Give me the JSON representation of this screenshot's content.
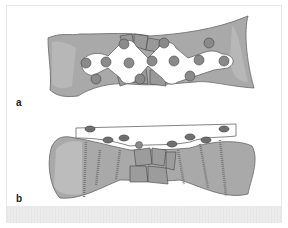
{
  "figure": {
    "panels": [
      {
        "id": "a",
        "label": "a",
        "description": "Top view of bone with bridging plate and screws over comminuted fracture"
      },
      {
        "id": "b",
        "label": "b",
        "description": "Side view of bone with plate, screws inserted, fracture fragments in middle"
      }
    ],
    "colors": {
      "bone": "#a9a9a9",
      "bone_light": "#c4c4c4",
      "plate": "#ffffff",
      "outline": "#555555",
      "fragment": "#9c9c9c"
    }
  }
}
